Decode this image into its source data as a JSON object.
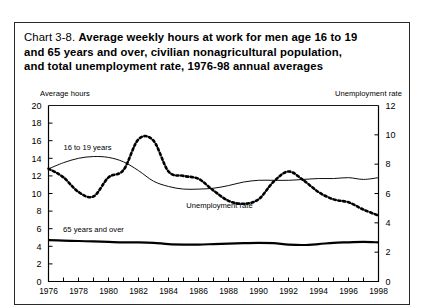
{
  "figure": {
    "number": "Chart 3-8.",
    "title": "Average weekly hours at work for men age 16 to 19 and 65  years and over, civilian nonagricultural population, and total unemployment rate, 1976-98 annual averages",
    "title_line1": "Average weekly hours at work for men age 16 to 19",
    "title_line2": "and 65  years and over, civilian nonagricultural population,",
    "title_line3": "and total unemployment rate, 1976-98 annual averages"
  },
  "chart_data": {
    "type": "line",
    "title": "Chart 3-8. Average weekly hours at work for men age 16 to 19 and 65  years and over, civilian nonagricultural population, and total unemployment rate, 1976-98 annual averages",
    "xlabel": "",
    "ylabel": "Average hours",
    "y2label": "Unemployment rate",
    "left_axis_caption": "Average hours",
    "right_axis_caption": "Unemployment rate",
    "xlim": [
      1976,
      1998
    ],
    "ylim": [
      0,
      20
    ],
    "y2lim": [
      0,
      12
    ],
    "yticks": [
      0,
      2,
      4,
      6,
      8,
      10,
      12,
      14,
      16,
      18,
      20
    ],
    "y2ticks": [
      0,
      2,
      4,
      6,
      8,
      10,
      12
    ],
    "xticks": [
      1976,
      1978,
      1980,
      1982,
      1984,
      1986,
      1988,
      1990,
      1992,
      1994,
      1996,
      1998
    ],
    "xticks_minor_every": 1,
    "grid": false,
    "legend_position": "inline-annotations",
    "x": [
      1976,
      1977,
      1978,
      1979,
      1980,
      1981,
      1982,
      1983,
      1984,
      1985,
      1986,
      1987,
      1988,
      1989,
      1990,
      1991,
      1992,
      1993,
      1994,
      1995,
      1996,
      1997,
      1998
    ],
    "series": [
      {
        "name": "16 to 19 years",
        "axis": "left",
        "units": "average weekly hours",
        "style": "thin-solid",
        "color": "#000000",
        "label_x": 1978.6,
        "label_y": 15.0,
        "values": [
          12.8,
          13.5,
          14.0,
          14.2,
          14.1,
          13.6,
          12.6,
          11.4,
          10.8,
          10.5,
          10.5,
          10.6,
          10.9,
          11.3,
          11.5,
          11.5,
          11.5,
          11.6,
          11.7,
          11.7,
          11.8,
          11.6,
          11.8
        ]
      },
      {
        "name": "65 years and over",
        "axis": "left",
        "units": "average weekly hours",
        "style": "thick-solid",
        "color": "#000000",
        "label_x": 1979.0,
        "label_y": 5.6,
        "values": [
          4.7,
          4.65,
          4.6,
          4.55,
          4.5,
          4.45,
          4.45,
          4.4,
          4.25,
          4.2,
          4.2,
          4.25,
          4.3,
          4.35,
          4.4,
          4.35,
          4.2,
          4.15,
          4.25,
          4.4,
          4.45,
          4.5,
          4.45
        ]
      },
      {
        "name": "Unemployment rate",
        "axis": "right",
        "units": "percent",
        "style": "dotted",
        "color": "#000000",
        "label_x": 1987.4,
        "label_y_left_scale": 8.4,
        "values": [
          7.7,
          7.1,
          6.1,
          5.8,
          7.1,
          7.6,
          9.7,
          9.6,
          7.5,
          7.2,
          7.0,
          6.2,
          5.5,
          5.3,
          5.6,
          6.8,
          7.5,
          6.9,
          6.1,
          5.6,
          5.4,
          4.9,
          4.5
        ]
      }
    ],
    "annotations": [
      {
        "text": "16 to 19 years",
        "series": "16 to 19 years"
      },
      {
        "text": "65 years and over",
        "series": "65 years and over"
      },
      {
        "text": "Unemployment rate",
        "series": "Unemployment rate"
      }
    ]
  }
}
